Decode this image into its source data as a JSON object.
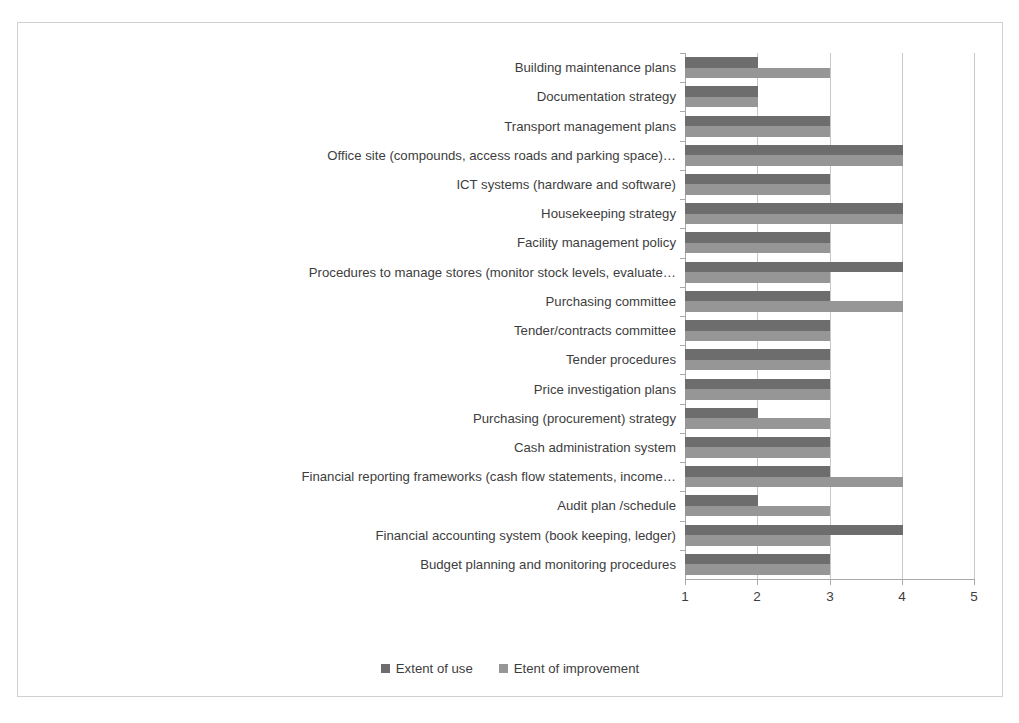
{
  "chart_data": {
    "type": "bar",
    "orientation": "horizontal",
    "title": "",
    "xlabel": "",
    "ylabel": "",
    "xlim": [
      1,
      5
    ],
    "xticks": [
      "1",
      "2",
      "3",
      "4",
      "5"
    ],
    "grid": true,
    "legend_position": "bottom",
    "categories": [
      "Budget planning and monitoring procedures",
      "Financial accounting system (book keeping, ledger)",
      "Audit plan /schedule",
      "Financial reporting frameworks (cash flow statements, income…",
      "Cash administration system",
      "Purchasing (procurement) strategy",
      "Price investigation plans",
      "Tender procedures",
      "Tender/contracts committee",
      "Purchasing committee",
      "Procedures to manage stores (monitor stock levels, evaluate…",
      "Facility management policy",
      "Housekeeping strategy",
      "ICT systems (hardware and software)",
      "Office site (compounds, access roads and parking space)…",
      "Transport management plans",
      "Documentation strategy",
      "Building maintenance plans"
    ],
    "series": [
      {
        "name": "Extent of use",
        "color": "#6d6d6d",
        "values": [
          3,
          4,
          2,
          3,
          3,
          2,
          3,
          3,
          3,
          3,
          4,
          3,
          4,
          3,
          4,
          3,
          2,
          2
        ]
      },
      {
        "name": "Etent of improvement",
        "color": "#969696",
        "values": [
          3,
          3,
          3,
          4,
          3,
          3,
          3,
          3,
          3,
          4,
          3,
          3,
          4,
          3,
          4,
          3,
          2,
          3
        ]
      }
    ]
  },
  "legend": {
    "entries": [
      {
        "label": "Extent of use"
      },
      {
        "label": "Etent of improvement"
      }
    ]
  }
}
